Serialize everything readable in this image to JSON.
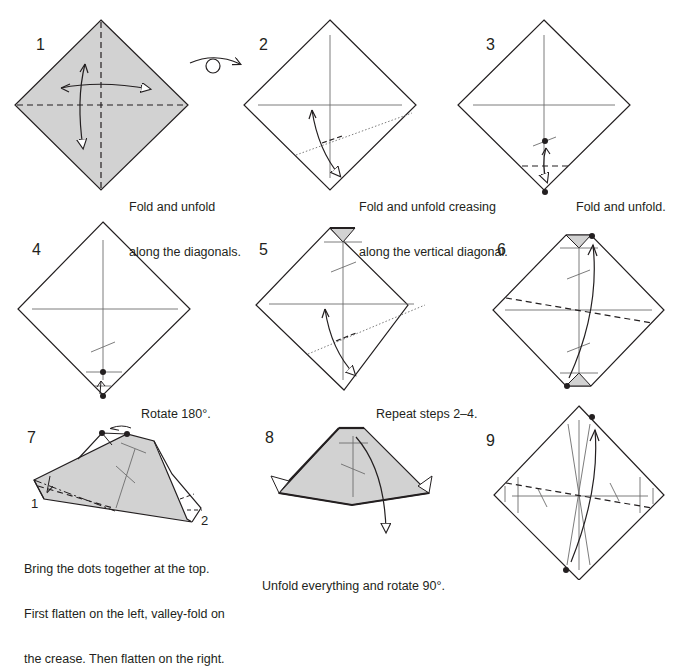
{
  "colors": {
    "paper_colored": "#d2d2d2",
    "paper_white": "#ffffff",
    "line": "#231f20",
    "crease": "#6d6d6d"
  },
  "steps": [
    {
      "number": "1",
      "caption_lines": [
        "Fold and unfold",
        "along the diagonals."
      ]
    },
    {
      "number": "2",
      "caption_lines": [
        "Fold and unfold creasing",
        "along the vertical diagonal."
      ]
    },
    {
      "number": "3",
      "caption_lines": [
        "Fold and unfold."
      ]
    },
    {
      "number": "4",
      "caption_lines": [
        "Rotate 180°."
      ]
    },
    {
      "number": "5",
      "caption_lines": [
        "Repeat steps 2–4."
      ]
    },
    {
      "number": "6",
      "caption_lines": []
    },
    {
      "number": "7",
      "caption_lines": [
        "Bring the dots together at the top.",
        "First flatten on the left, valley-fold on",
        "the crease. Then flatten on the right."
      ],
      "point_labels": [
        "1",
        "2"
      ]
    },
    {
      "number": "8",
      "caption_lines": [
        "Unfold everything and rotate 90°."
      ]
    },
    {
      "number": "9",
      "caption_lines": []
    }
  ],
  "symbols": {
    "turn_over": "turn-over-icon"
  }
}
